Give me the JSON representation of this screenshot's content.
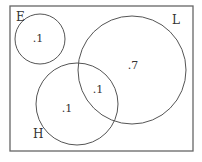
{
  "diagram": {
    "type": "venn",
    "stroke_color": "#555555",
    "universe": {
      "x": 10,
      "y": 6,
      "width": 183,
      "height": 145
    },
    "sets": [
      {
        "name": "E",
        "label": "E",
        "cx": 40,
        "cy": 39,
        "r": 25,
        "label_x": 16,
        "label_y": 21
      },
      {
        "name": "L",
        "label": "L",
        "cx": 132,
        "cy": 70,
        "r": 54,
        "label_x": 172,
        "label_y": 24
      },
      {
        "name": "H",
        "label": "H",
        "cx": 77,
        "cy": 104,
        "r": 41,
        "label_x": 33,
        "label_y": 138
      }
    ],
    "regions": [
      {
        "region": "E only",
        "value": ".1",
        "x": 38,
        "y": 42
      },
      {
        "region": "L only",
        "value": ".7",
        "x": 133,
        "y": 69
      },
      {
        "region": "H only",
        "value": ".1",
        "x": 67,
        "y": 112
      },
      {
        "region": "H and L",
        "value": ".1",
        "x": 98,
        "y": 93
      }
    ]
  }
}
